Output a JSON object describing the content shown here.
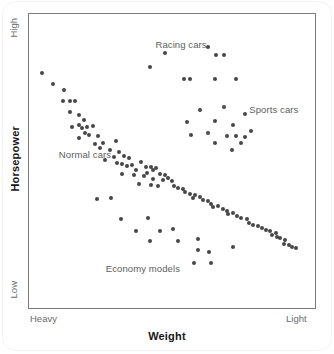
{
  "chart_data": {
    "type": "scatter",
    "title": "",
    "xlabel": "Weight",
    "ylabel": "Horsepower",
    "x_tick_labels": [
      "Heavy",
      "Light"
    ],
    "y_tick_labels": [
      "High",
      "Low"
    ],
    "xlim": [
      "Heavy",
      "Light"
    ],
    "ylim": [
      "Low",
      "High"
    ],
    "grid": false,
    "legend": "inline-annotations",
    "point_color": "#474747",
    "frame_color": "#7a7a7a",
    "annotations": [
      {
        "label": "Racing cars",
        "x": 0.44,
        "y": 0.91
      },
      {
        "label": "Sports cars",
        "x": 0.78,
        "y": 0.68
      },
      {
        "label": "Normal cars",
        "x": 0.09,
        "y": 0.52
      },
      {
        "label": "Economy models",
        "x": 0.26,
        "y": 0.12
      }
    ],
    "series": [
      {
        "name": "Normal cars",
        "points": [
          [
            0.028,
            0.81
          ],
          [
            0.07,
            0.77
          ],
          [
            0.107,
            0.75
          ],
          [
            0.104,
            0.712
          ],
          [
            0.129,
            0.712
          ],
          [
            0.147,
            0.712
          ],
          [
            0.132,
            0.674
          ],
          [
            0.164,
            0.663
          ],
          [
            0.182,
            0.645
          ],
          [
            0.136,
            0.62
          ],
          [
            0.164,
            0.628
          ],
          [
            0.175,
            0.616
          ],
          [
            0.193,
            0.62
          ],
          [
            0.214,
            0.624
          ],
          [
            0.186,
            0.597
          ],
          [
            0.2,
            0.592
          ],
          [
            0.232,
            0.589
          ],
          [
            0.164,
            0.58
          ],
          [
            0.221,
            0.561
          ],
          [
            0.25,
            0.565
          ],
          [
            0.239,
            0.545
          ],
          [
            0.296,
            0.572
          ],
          [
            0.275,
            0.537
          ],
          [
            0.307,
            0.53
          ],
          [
            0.289,
            0.515
          ],
          [
            0.325,
            0.516
          ],
          [
            0.257,
            0.505
          ],
          [
            0.343,
            0.512
          ],
          [
            0.3,
            0.492
          ],
          [
            0.318,
            0.488
          ],
          [
            0.336,
            0.482
          ],
          [
            0.354,
            0.486
          ],
          [
            0.389,
            0.497
          ],
          [
            0.368,
            0.47
          ],
          [
            0.407,
            0.48
          ],
          [
            0.425,
            0.478
          ],
          [
            0.432,
            0.468
          ],
          [
            0.443,
            0.474
          ],
          [
            0.411,
            0.458
          ],
          [
            0.318,
            0.455
          ],
          [
            0.361,
            0.45
          ],
          [
            0.4,
            0.447
          ],
          [
            0.457,
            0.455
          ],
          [
            0.475,
            0.452
          ],
          [
            0.432,
            0.437
          ],
          [
            0.468,
            0.432
          ],
          [
            0.486,
            0.44
          ],
          [
            0.5,
            0.428
          ],
          [
            0.382,
            0.42
          ],
          [
            0.425,
            0.416
          ],
          [
            0.45,
            0.412
          ],
          [
            0.507,
            0.412
          ],
          [
            0.521,
            0.405
          ],
          [
            0.539,
            0.4
          ],
          [
            0.546,
            0.392
          ],
          [
            0.564,
            0.385
          ],
          [
            0.582,
            0.382
          ],
          [
            0.575,
            0.368
          ],
          [
            0.6,
            0.372
          ],
          [
            0.611,
            0.362
          ],
          [
            0.629,
            0.358
          ],
          [
            0.643,
            0.35
          ],
          [
            0.65,
            0.338
          ],
          [
            0.668,
            0.342
          ],
          [
            0.686,
            0.332
          ],
          [
            0.7,
            0.325
          ],
          [
            0.704,
            0.312
          ],
          [
            0.721,
            0.318
          ],
          [
            0.736,
            0.305
          ],
          [
            0.75,
            0.3
          ],
          [
            0.771,
            0.295
          ],
          [
            0.779,
            0.282
          ],
          [
            0.793,
            0.275
          ],
          [
            0.811,
            0.272
          ],
          [
            0.825,
            0.265
          ],
          [
            0.839,
            0.258
          ],
          [
            0.854,
            0.252
          ],
          [
            0.861,
            0.24
          ],
          [
            0.875,
            0.245
          ],
          [
            0.882,
            0.232
          ],
          [
            0.893,
            0.228
          ],
          [
            0.911,
            0.222
          ],
          [
            0.904,
            0.208
          ],
          [
            0.925,
            0.205
          ],
          [
            0.936,
            0.198
          ],
          [
            0.95,
            0.192
          ]
        ]
      },
      {
        "name": "Racing cars",
        "points": [
          [
            0.42,
            0.832
          ],
          [
            0.476,
            0.88
          ],
          [
            0.545,
            0.79
          ],
          [
            0.566,
            0.79
          ],
          [
            0.631,
            0.9
          ],
          [
            0.66,
            0.875
          ],
          [
            0.655,
            0.79
          ],
          [
            0.732,
            0.79
          ],
          [
            0.69,
            0.872
          ]
        ]
      },
      {
        "name": "Sports cars",
        "points": [
          [
            0.6,
            0.68
          ],
          [
            0.69,
            0.69
          ],
          [
            0.765,
            0.665
          ],
          [
            0.555,
            0.638
          ],
          [
            0.656,
            0.64
          ],
          [
            0.72,
            0.628
          ],
          [
            0.57,
            0.592
          ],
          [
            0.629,
            0.6
          ],
          [
            0.7,
            0.587
          ],
          [
            0.732,
            0.588
          ],
          [
            0.764,
            0.585
          ],
          [
            0.655,
            0.565
          ],
          [
            0.75,
            0.565
          ],
          [
            0.718,
            0.54
          ],
          [
            0.787,
            0.605
          ]
        ]
      },
      {
        "name": "Economy models",
        "points": [
          [
            0.228,
            0.365
          ],
          [
            0.28,
            0.368
          ],
          [
            0.314,
            0.295
          ],
          [
            0.412,
            0.298
          ],
          [
            0.37,
            0.255
          ],
          [
            0.455,
            0.252
          ],
          [
            0.505,
            0.262
          ],
          [
            0.42,
            0.218
          ],
          [
            0.52,
            0.22
          ],
          [
            0.593,
            0.225
          ],
          [
            0.596,
            0.188
          ],
          [
            0.635,
            0.178
          ],
          [
            0.58,
            0.142
          ],
          [
            0.64,
            0.142
          ],
          [
            0.72,
            0.198
          ]
        ]
      }
    ]
  },
  "axes": {
    "y_high": "High",
    "y_low": "Low",
    "x_left": "Heavy",
    "x_right": "Light",
    "y_title": "Horsepower",
    "x_title": "Weight"
  }
}
